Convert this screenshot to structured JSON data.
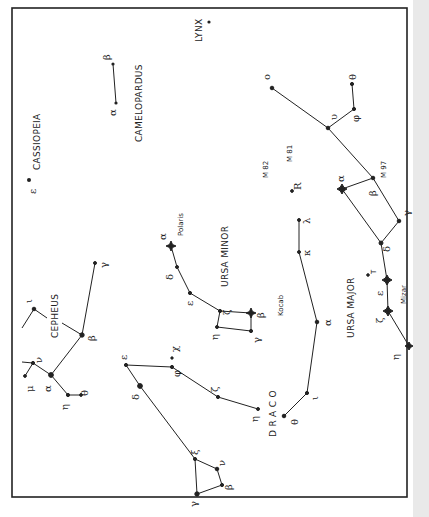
{
  "colors": {
    "ink": "#222222",
    "paper": "#ffffff",
    "page_edge": "#e9e9e9"
  },
  "constellations": {
    "lynx": {
      "label": "LYNX"
    },
    "camelopardus": {
      "label": "CAMELOPARDUS",
      "stars": {
        "alpha": "α",
        "beta": "β"
      }
    },
    "cassiopeia": {
      "label": "CASSIOPEIA",
      "stars": {
        "epsilon": "ε"
      }
    },
    "cepheus": {
      "label": "CEPHEUS",
      "stars": {
        "alpha": "α",
        "beta": "β",
        "gamma": "γ",
        "eta": "η",
        "theta": "θ",
        "iota": "ι",
        "mu": "μ",
        "nu": "ν"
      }
    },
    "ursa_minor": {
      "label": "URSA MINOR",
      "named_stars": {
        "polaris": "Polaris",
        "kocab": "Kocab"
      },
      "stars": {
        "alpha": "α",
        "beta": "β",
        "gamma": "γ",
        "delta": "δ",
        "epsilon": "ε",
        "zeta": "ζ",
        "eta": "η"
      }
    },
    "ursa_major": {
      "label": "URSA MAJOR",
      "named_stars": {
        "mizar": "Mizar"
      },
      "stars": {
        "alpha": "α",
        "beta": "β",
        "gamma": "γ",
        "delta": "δ",
        "epsilon": "ε",
        "zeta": "ζ",
        "eta": "η",
        "omicron": "o",
        "upsilon": "υ",
        "phi": "φ",
        "theta": "θ"
      },
      "objects": {
        "m97": "M 97",
        "m81": "M 81",
        "m82": "M 82",
        "r": "R",
        "t": "T"
      }
    },
    "draco": {
      "label": "D R A C O",
      "stars": {
        "alpha": "α",
        "beta": "β",
        "gamma": "γ",
        "delta": "δ",
        "epsilon": "ε",
        "zeta": "ζ",
        "eta": "η",
        "theta": "θ",
        "iota": "ι",
        "kappa": "κ",
        "lambda": "λ",
        "xi": "ξ",
        "nu": "ν",
        "phi": "φ",
        "chi": "χ"
      }
    }
  }
}
